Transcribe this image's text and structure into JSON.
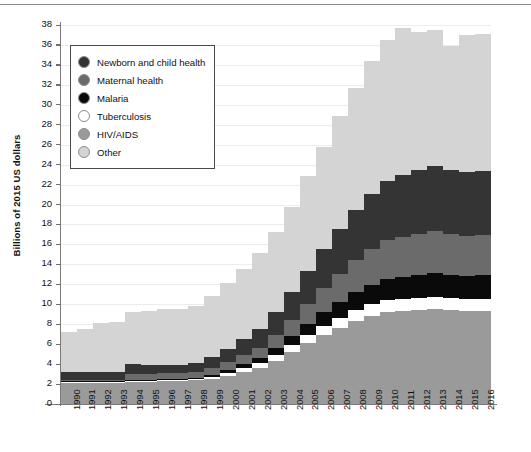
{
  "chart_data": {
    "type": "bar",
    "stacked": true,
    "title": "",
    "xlabel": "",
    "ylabel": "Billions of 2015 US dollars",
    "ylim": [
      0,
      38
    ],
    "ytick_step": 2,
    "yticks": [
      0,
      2,
      4,
      6,
      8,
      10,
      12,
      14,
      16,
      18,
      20,
      22,
      24,
      26,
      28,
      30,
      32,
      34,
      36,
      38
    ],
    "grid": true,
    "legend_position": "upper-left-inside",
    "categories": [
      "1990",
      "1991",
      "1992",
      "1993",
      "1994",
      "1995",
      "1996",
      "1997",
      "1998",
      "1999",
      "2000",
      "2001",
      "2002",
      "2003",
      "2004",
      "2005",
      "2006",
      "2007",
      "2008",
      "2009",
      "2010",
      "2011",
      "2012",
      "2013",
      "2014",
      "2015",
      "2016"
    ],
    "stack_order_bottom_to_top": [
      "HIV/AIDS",
      "Tuberculosis",
      "Malaria",
      "Maternal health",
      "Newborn and child health",
      "Other"
    ],
    "series": [
      {
        "name": "HIV/AIDS",
        "color": "#9a9a9a",
        "values": [
          2.2,
          2.2,
          2.2,
          2.2,
          2.3,
          2.3,
          2.4,
          2.4,
          2.4,
          2.5,
          2.8,
          3.2,
          3.6,
          4.3,
          5.2,
          6.1,
          6.9,
          7.6,
          8.3,
          8.8,
          9.2,
          9.3,
          9.4,
          9.5,
          9.4,
          9.3,
          9.3
        ]
      },
      {
        "name": "Tuberculosis",
        "color": "#ffffff",
        "values": [
          0.05,
          0.05,
          0.05,
          0.05,
          0.05,
          0.05,
          0.05,
          0.05,
          0.1,
          0.2,
          0.3,
          0.4,
          0.5,
          0.6,
          0.7,
          0.8,
          0.9,
          1.0,
          1.1,
          1.2,
          1.2,
          1.2,
          1.2,
          1.2,
          1.2,
          1.2,
          1.2
        ]
      },
      {
        "name": "Malaria",
        "color": "#0a0a0a",
        "values": [
          0.05,
          0.05,
          0.05,
          0.05,
          0.05,
          0.05,
          0.05,
          0.05,
          0.1,
          0.2,
          0.3,
          0.4,
          0.5,
          0.7,
          0.9,
          1.1,
          1.4,
          1.6,
          1.8,
          1.9,
          2.1,
          2.2,
          2.3,
          2.4,
          2.3,
          2.3,
          2.4
        ]
      },
      {
        "name": "Maternal health",
        "color": "#6b6b6b",
        "values": [
          0.1,
          0.1,
          0.1,
          0.1,
          0.6,
          0.6,
          0.6,
          0.6,
          0.6,
          0.7,
          0.8,
          0.9,
          1.0,
          1.3,
          1.6,
          2.0,
          2.4,
          2.8,
          3.2,
          3.6,
          3.9,
          4.0,
          4.1,
          4.2,
          4.1,
          4.0,
          4.0
        ]
      },
      {
        "name": "Newborn and child health",
        "color": "#343434",
        "values": [
          0.8,
          0.8,
          0.8,
          0.8,
          1.0,
          0.9,
          0.8,
          0.8,
          0.9,
          1.1,
          1.3,
          1.6,
          1.9,
          2.3,
          2.8,
          3.3,
          3.9,
          4.5,
          5.1,
          5.6,
          6.0,
          6.3,
          6.5,
          6.6,
          6.5,
          6.5,
          6.5
        ]
      },
      {
        "name": "Other",
        "color": "#d4d4d4",
        "values": [
          4.0,
          4.3,
          4.9,
          5.0,
          5.2,
          5.4,
          5.6,
          5.6,
          5.7,
          6.1,
          6.6,
          7.0,
          7.6,
          8.0,
          8.6,
          9.6,
          10.3,
          11.4,
          12.2,
          13.3,
          14.1,
          14.7,
          13.8,
          13.6,
          12.4,
          13.7,
          13.7
        ]
      }
    ],
    "totals": [
      7.2,
      7.5,
      8.1,
      8.2,
      9.2,
      9.3,
      9.5,
      9.5,
      9.8,
      10.8,
      12.1,
      13.5,
      15.1,
      17.2,
      19.8,
      22.9,
      25.8,
      28.9,
      31.7,
      34.4,
      36.5,
      37.7,
      37.3,
      37.5,
      35.9,
      37.0,
      37.1
    ]
  },
  "legend": {
    "items": [
      {
        "label": "Newborn and child health",
        "color": "#343434"
      },
      {
        "label": "Maternal health",
        "color": "#6b6b6b"
      },
      {
        "label": "Malaria",
        "color": "#0a0a0a"
      },
      {
        "label": "Tuberculosis",
        "color": "#ffffff"
      },
      {
        "label": "HIV/AIDS",
        "color": "#9a9a9a"
      },
      {
        "label": "Other",
        "color": "#d4d4d4"
      }
    ]
  },
  "colors": {
    "axis": "#7b7b7b",
    "grid": "#ececec",
    "text": "#111111",
    "background": "#ffffff",
    "legend_border": "#4a4a4a"
  }
}
